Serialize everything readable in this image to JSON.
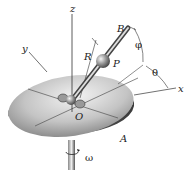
{
  "diagram": {
    "labels": {
      "z": "z",
      "y": "y",
      "x": "x",
      "B": "B",
      "R": "R",
      "P": "P",
      "phi": "φ",
      "theta": "θ",
      "O": "O",
      "A": "A",
      "omega": "ω"
    },
    "colors": {
      "disk_light": "#e8e8e8",
      "disk_mid": "#b0b0b0",
      "disk_dark": "#555555",
      "line": "#333333"
    }
  }
}
